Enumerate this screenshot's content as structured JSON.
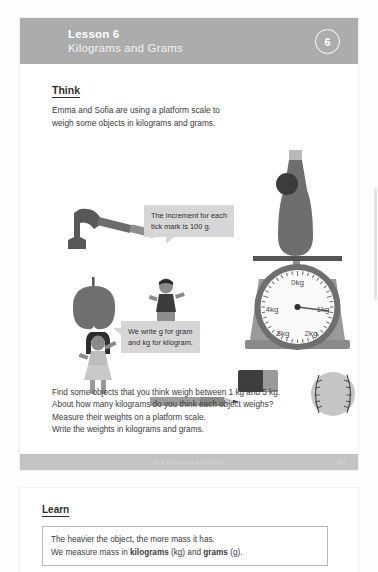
{
  "header": {
    "lesson_label": "Lesson 6",
    "lesson_subtitle": "Kilograms and Grams",
    "badge_number": "6",
    "band_color": "#acacac"
  },
  "think": {
    "heading": "Think",
    "body_line1": "Emma and Sofia are using a platform scale to",
    "body_line2": "weigh some objects in kilograms and grams."
  },
  "bubbles": {
    "tick_increment": {
      "line1": "The increment for each",
      "line2": "tick mark is 100 g."
    },
    "units": {
      "line1": "We write g for gram",
      "line2": "and kg for kilogram."
    }
  },
  "scale": {
    "dial_labels": [
      "0kg",
      "1kg",
      "2kg",
      "3kg",
      "4kg"
    ],
    "needle_points_to": "1kg",
    "object_on_scale": "bottle"
  },
  "illustrations": [
    {
      "name": "hammer"
    },
    {
      "name": "apple"
    },
    {
      "name": "boy-figure"
    },
    {
      "name": "girl-figure"
    },
    {
      "name": "eraser"
    },
    {
      "name": "pencil"
    },
    {
      "name": "baseball"
    },
    {
      "name": "platform-scale"
    },
    {
      "name": "bottle"
    }
  ],
  "instructions": {
    "line1": "Find some objects that you think weigh between 1 kg and 5 kg.",
    "line2": "About how many kilograms do you think each object weighs?",
    "line3": "Measure their weights on a platform scale.",
    "line4": "Write the weights in kilograms and grams."
  },
  "footer": {
    "chapter": "11.6 Kilograms and Grams",
    "page_number": "107"
  },
  "learn": {
    "heading": "Learn",
    "box_line1": "The heavier the object, the more mass it has.",
    "box_line2_a": "We measure mass in ",
    "box_line2_b": "kilograms",
    "box_line2_c": " (kg) and ",
    "box_line2_d": "grams",
    "box_line2_e": " (g)."
  }
}
